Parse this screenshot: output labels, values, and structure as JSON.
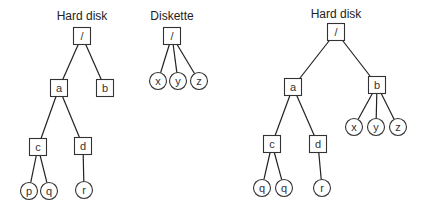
{
  "diagram": {
    "colors": {
      "stroke": "#333333",
      "text": "#222222",
      "background": "#ffffff"
    },
    "trees": [
      {
        "label": "Hard disk",
        "label_pos": [
          82,
          20
        ],
        "nodes": [
          {
            "id": "L_root",
            "text": "/",
            "shape": "box",
            "x": 82,
            "y": 36
          },
          {
            "id": "L_a",
            "text": "a",
            "shape": "box",
            "x": 59,
            "y": 88
          },
          {
            "id": "L_b",
            "text": "b",
            "shape": "box",
            "x": 105,
            "y": 88
          },
          {
            "id": "L_c",
            "text": "c",
            "shape": "box",
            "x": 38,
            "y": 147
          },
          {
            "id": "L_d",
            "text": "d",
            "shape": "box",
            "x": 83,
            "y": 146
          },
          {
            "id": "L_p",
            "text": "p",
            "shape": "circle",
            "x": 29,
            "y": 191
          },
          {
            "id": "L_q",
            "text": "q",
            "shape": "circle",
            "x": 49,
            "y": 191
          },
          {
            "id": "L_r",
            "text": "r",
            "shape": "circle",
            "x": 84,
            "y": 190
          }
        ],
        "edges": [
          [
            "L_root",
            "L_a"
          ],
          [
            "L_root",
            "L_b"
          ],
          [
            "L_a",
            "L_c"
          ],
          [
            "L_a",
            "L_d"
          ],
          [
            "L_c",
            "L_p"
          ],
          [
            "L_c",
            "L_q"
          ],
          [
            "L_d",
            "L_r"
          ]
        ]
      },
      {
        "label": "Diskette",
        "label_pos": [
          172,
          20
        ],
        "nodes": [
          {
            "id": "D_root",
            "text": "/",
            "shape": "box",
            "x": 172,
            "y": 36
          },
          {
            "id": "D_x",
            "text": "x",
            "shape": "circle",
            "x": 158,
            "y": 81
          },
          {
            "id": "D_y",
            "text": "y",
            "shape": "circle",
            "x": 178,
            "y": 81
          },
          {
            "id": "D_z",
            "text": "z",
            "shape": "circle",
            "x": 199,
            "y": 81
          }
        ],
        "edges": [
          [
            "D_root",
            "D_x"
          ],
          [
            "D_root",
            "D_y"
          ],
          [
            "D_root",
            "D_z"
          ]
        ]
      },
      {
        "label": "Hard disk",
        "label_pos": [
          336,
          18
        ],
        "nodes": [
          {
            "id": "R_root",
            "text": "/",
            "shape": "box",
            "x": 336,
            "y": 32
          },
          {
            "id": "R_a",
            "text": "a",
            "shape": "box",
            "x": 293,
            "y": 87
          },
          {
            "id": "R_b",
            "text": "b",
            "shape": "box",
            "x": 377,
            "y": 85
          },
          {
            "id": "R_x",
            "text": "x",
            "shape": "circle",
            "x": 354,
            "y": 127
          },
          {
            "id": "R_y",
            "text": "y",
            "shape": "circle",
            "x": 376,
            "y": 127
          },
          {
            "id": "R_z",
            "text": "z",
            "shape": "circle",
            "x": 398,
            "y": 127
          },
          {
            "id": "R_c",
            "text": "c",
            "shape": "box",
            "x": 272,
            "y": 144
          },
          {
            "id": "R_d",
            "text": "d",
            "shape": "box",
            "x": 318,
            "y": 144
          },
          {
            "id": "R_q1",
            "text": "q",
            "shape": "circle",
            "x": 262,
            "y": 188
          },
          {
            "id": "R_q2",
            "text": "q",
            "shape": "circle",
            "x": 284,
            "y": 188
          },
          {
            "id": "R_r",
            "text": "r",
            "shape": "circle",
            "x": 322,
            "y": 188
          }
        ],
        "edges": [
          [
            "R_root",
            "R_a"
          ],
          [
            "R_root",
            "R_b"
          ],
          [
            "R_b",
            "R_x"
          ],
          [
            "R_b",
            "R_y"
          ],
          [
            "R_b",
            "R_z"
          ],
          [
            "R_a",
            "R_c"
          ],
          [
            "R_a",
            "R_d"
          ],
          [
            "R_c",
            "R_q1"
          ],
          [
            "R_c",
            "R_q2"
          ],
          [
            "R_d",
            "R_r"
          ]
        ]
      }
    ]
  }
}
